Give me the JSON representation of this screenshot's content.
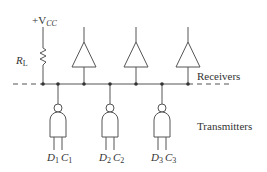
{
  "diagram": {
    "supply_label": {
      "prefix": "+V",
      "sub": "CC"
    },
    "resistor_label": {
      "main": "R",
      "sub": "L"
    },
    "receivers_label": "Receivers",
    "transmitters_label": "Transmitters",
    "transmitters": [
      {
        "d_main": "D",
        "d_sub": "1",
        "c_main": "C",
        "c_sub": "1"
      },
      {
        "d_main": "D",
        "d_sub": "2",
        "c_main": "C",
        "c_sub": "2"
      },
      {
        "d_main": "D",
        "d_sub": "3",
        "c_main": "C",
        "c_sub": "3"
      }
    ],
    "receiver_count": 3
  }
}
